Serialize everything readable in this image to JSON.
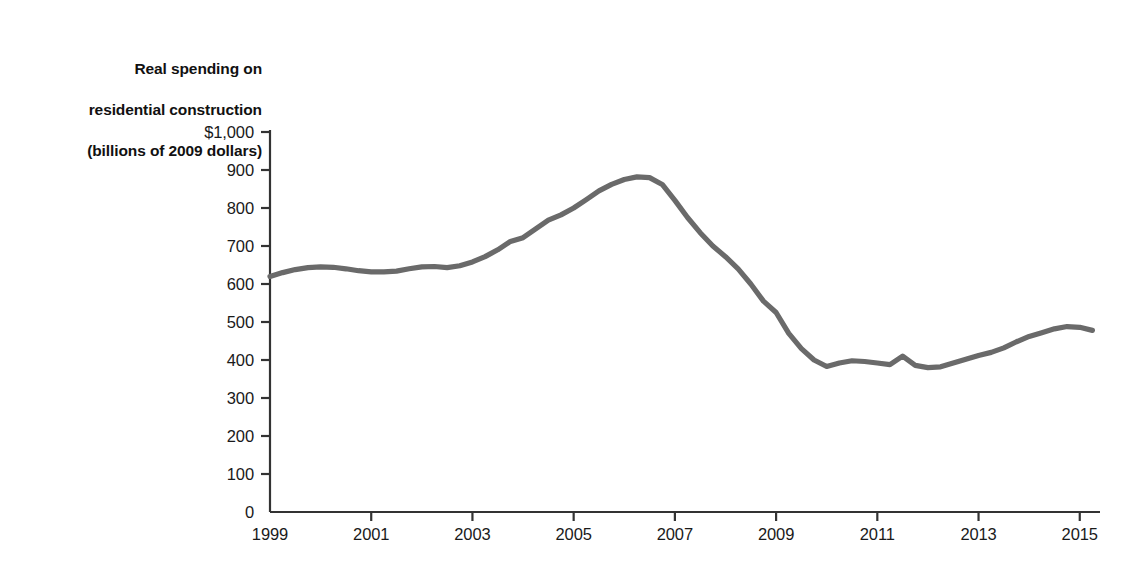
{
  "chart_data": {
    "type": "line",
    "title": "Real spending on residential construction (billions of 2009 dollars)",
    "title_lines": [
      "Real spending on",
      "residential construction",
      "(billions of 2009 dollars)"
    ],
    "xlabel": "",
    "ylabel": "Real spending on residential construction (billions of 2009 dollars)",
    "xlim": [
      1999,
      2015.4
    ],
    "ylim": [
      0,
      1000
    ],
    "y_ticks": [
      0,
      100,
      200,
      300,
      400,
      500,
      600,
      700,
      800,
      900,
      1000
    ],
    "y_tick_labels": [
      "0",
      "100",
      "200",
      "300",
      "400",
      "500",
      "600",
      "700",
      "800",
      "900",
      "$1,000"
    ],
    "x_ticks": [
      1999,
      2001,
      2003,
      2005,
      2007,
      2009,
      2011,
      2013,
      2015
    ],
    "x_tick_labels": [
      "1999",
      "2001",
      "2003",
      "2005",
      "2007",
      "2009",
      "2011",
      "2013",
      "2015"
    ],
    "x_minor_step": 0.25,
    "grid": false,
    "legend": null,
    "line_color": "#6a6a6a",
    "line_width": 5.2,
    "axis_color": "#333333",
    "series": [
      {
        "name": "Real spending on residential construction",
        "units": "billions of 2009 dollars",
        "x": [
          1999.0,
          1999.25,
          1999.5,
          1999.75,
          2000.0,
          2000.25,
          2000.5,
          2000.75,
          2001.0,
          2001.25,
          2001.5,
          2001.75,
          2002.0,
          2002.25,
          2002.5,
          2002.75,
          2003.0,
          2003.25,
          2003.5,
          2003.75,
          2004.0,
          2004.25,
          2004.5,
          2004.75,
          2005.0,
          2005.25,
          2005.5,
          2005.75,
          2006.0,
          2006.25,
          2006.5,
          2006.75,
          2007.0,
          2007.25,
          2007.5,
          2007.75,
          2008.0,
          2008.25,
          2008.5,
          2008.75,
          2009.0,
          2009.25,
          2009.5,
          2009.75,
          2010.0,
          2010.25,
          2010.5,
          2010.75,
          2011.0,
          2011.25,
          2011.5,
          2011.75,
          2012.0,
          2012.25,
          2012.5,
          2012.75,
          2013.0,
          2013.25,
          2013.5,
          2013.75,
          2014.0,
          2014.25,
          2014.5,
          2014.75,
          2015.0,
          2015.25
        ],
        "y": [
          620,
          630,
          638,
          643,
          645,
          644,
          640,
          635,
          632,
          632,
          634,
          640,
          645,
          646,
          643,
          648,
          658,
          672,
          690,
          712,
          722,
          745,
          768,
          782,
          800,
          822,
          845,
          862,
          875,
          882,
          880,
          862,
          820,
          775,
          735,
          700,
          672,
          640,
          600,
          555,
          525,
          470,
          430,
          400,
          383,
          392,
          398,
          396,
          392,
          388,
          410,
          386,
          380,
          382,
          392,
          402,
          412,
          420,
          432,
          448,
          462,
          472,
          482,
          488,
          486,
          478
        ]
      }
    ],
    "annotations": [],
    "notable_points": {
      "start": {
        "year": 1999,
        "value": 620
      },
      "peak": {
        "year": 2006.25,
        "value": 882
      },
      "trough": {
        "year": 2010.0,
        "value": 383
      },
      "secondary_trough": {
        "year": 2012.0,
        "value": 380
      },
      "end": {
        "year": 2015.4,
        "value": 523
      }
    }
  }
}
